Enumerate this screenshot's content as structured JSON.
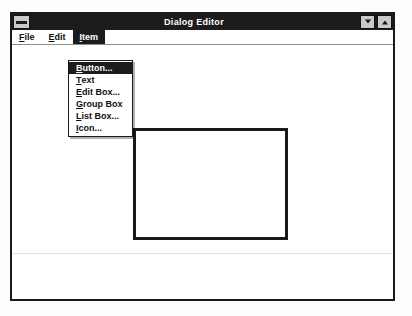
{
  "window": {
    "title": "Dialog Editor",
    "sysmenu_icon": "system-menu-icon",
    "minimize_label": "",
    "maximize_label": ""
  },
  "menubar": {
    "items": [
      {
        "label": "File",
        "accel": "F",
        "active": false
      },
      {
        "label": "Edit",
        "accel": "E",
        "active": false
      },
      {
        "label": "Item",
        "accel": "I",
        "active": true
      }
    ]
  },
  "dropdown": {
    "owner": "Item",
    "items": [
      {
        "label": "Button...",
        "accel": "B",
        "highlight": true
      },
      {
        "label": "Text",
        "accel": "T",
        "highlight": false
      },
      {
        "label": "Edit Box...",
        "accel": "E",
        "highlight": false
      },
      {
        "label": "Group Box",
        "accel": "G",
        "highlight": false
      },
      {
        "label": "List Box...",
        "accel": "L",
        "highlight": false
      },
      {
        "label": "Icon...",
        "accel": "I",
        "highlight": false
      }
    ]
  },
  "canvas": {
    "shapes": [
      {
        "type": "rectangle",
        "name": "dialog-outline",
        "x": 121,
        "y": 83,
        "width": 155,
        "height": 112
      }
    ],
    "guide_line_y": 208
  },
  "colors": {
    "titlebar_bg": "#1c1c1c",
    "titlebar_fg": "#ffffff",
    "window_bg": "#ffffff",
    "border": "#1a1a1a",
    "button_face": "#c9c9c9",
    "highlight_bg": "#1c1c1c",
    "highlight_fg": "#ffffff"
  }
}
